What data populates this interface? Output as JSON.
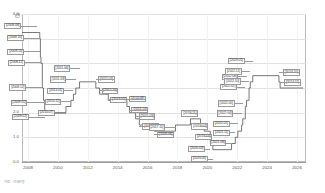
{
  "chart": {
    "unit_label": "(연 %)",
    "footnote": "자료 : 한국은행",
    "yaxis": {
      "ticks": [
        "6.0",
        "5.0",
        "4.0",
        "3.0",
        "2.0",
        "1.0",
        "0.0"
      ],
      "min": 0.0,
      "max": 6.0
    },
    "xaxis": {
      "ticks": [
        "2008",
        "2010",
        "2012",
        "2014",
        "2016",
        "2018",
        "2020",
        "2022",
        "2024",
        "2026"
      ],
      "min": 2007.6,
      "max": 2026.6
    }
  },
  "chart_data": {
    "type": "line",
    "title": "",
    "subtitle": "",
    "xlabel": "",
    "ylabel": "(연 %)",
    "xlim": [
      2007.6,
      2026.6
    ],
    "ylim": [
      0.0,
      6.0
    ],
    "grid": true,
    "legend": "none",
    "step": "post",
    "series": [
      {
        "name": "기준금리",
        "points": [
          {
            "date": "2008.08",
            "x": 2008.62,
            "y": 5.25
          },
          {
            "date": "2008.10",
            "x": 2008.79,
            "y": 5.0
          },
          {
            "date": "2008.10",
            "x": 2008.83,
            "y": 4.25
          },
          {
            "date": "2008.11",
            "x": 2008.87,
            "y": 4.0
          },
          {
            "date": "2008.12",
            "x": 2008.96,
            "y": 3.0
          },
          {
            "date": "2009.01",
            "x": 2009.04,
            "y": 2.5
          },
          {
            "date": "2009.02",
            "x": 2009.12,
            "y": 2.0
          },
          {
            "date": "2010.07",
            "x": 2010.54,
            "y": 2.25
          },
          {
            "date": "2010.11",
            "x": 2010.87,
            "y": 2.5
          },
          {
            "date": "2011.01",
            "x": 2011.04,
            "y": 2.75
          },
          {
            "date": "2011.03",
            "x": 2011.2,
            "y": 3.0
          },
          {
            "date": "2011.06",
            "x": 2011.45,
            "y": 3.25
          },
          {
            "date": "2012.07",
            "x": 2012.54,
            "y": 3.0
          },
          {
            "date": "2012.10",
            "x": 2012.79,
            "y": 2.75
          },
          {
            "date": "2013.05",
            "x": 2013.37,
            "y": 2.5
          },
          {
            "date": "2014.08",
            "x": 2014.62,
            "y": 2.25
          },
          {
            "date": "2014.10",
            "x": 2014.79,
            "y": 2.0
          },
          {
            "date": "2015.03",
            "x": 2015.2,
            "y": 1.75
          },
          {
            "date": "2015.06",
            "x": 2015.45,
            "y": 1.5
          },
          {
            "date": "2016.06",
            "x": 2016.45,
            "y": 1.25
          },
          {
            "date": "2017.11",
            "x": 2017.87,
            "y": 1.5
          },
          {
            "date": "2018.11",
            "x": 2018.87,
            "y": 1.75
          },
          {
            "date": "2019.07",
            "x": 2019.54,
            "y": 1.5
          },
          {
            "date": "2019.10",
            "x": 2019.79,
            "y": 1.25
          },
          {
            "date": "2020.03",
            "x": 2020.2,
            "y": 0.75
          },
          {
            "date": "2020.05",
            "x": 2020.37,
            "y": 0.5
          },
          {
            "date": "2021.08",
            "x": 2021.62,
            "y": 0.75
          },
          {
            "date": "2021.11",
            "x": 2021.87,
            "y": 1.0
          },
          {
            "date": "2022.01",
            "x": 2022.04,
            "y": 1.25
          },
          {
            "date": "2022.04",
            "x": 2022.29,
            "y": 1.5
          },
          {
            "date": "2022.05",
            "x": 2022.37,
            "y": 1.75
          },
          {
            "date": "2022.07",
            "x": 2022.54,
            "y": 2.25
          },
          {
            "date": "2022.08",
            "x": 2022.62,
            "y": 2.5
          },
          {
            "date": "2022.10",
            "x": 2022.79,
            "y": 3.0
          },
          {
            "date": "2022.11",
            "x": 2022.87,
            "y": 3.25
          },
          {
            "date": "2023.01",
            "x": 2023.04,
            "y": 3.5
          },
          {
            "date": "2024.10",
            "x": 2024.79,
            "y": 3.25
          },
          {
            "date": "2024.11",
            "x": 2024.87,
            "y": 3.0
          },
          {
            "date": "END",
            "x": 2026.4,
            "y": 3.0
          }
        ]
      }
    ],
    "annotations": [
      {
        "label": "[2008.08]",
        "x": 2008.62,
        "y": 5.25
      },
      {
        "label": "[2008.10]",
        "x": 2008.79,
        "y": 5.0
      },
      {
        "label": "[2008.10]",
        "x": 2008.83,
        "y": 4.25
      },
      {
        "label": "[2008.11]",
        "x": 2008.87,
        "y": 4.0
      },
      {
        "label": "[2008.12]",
        "x": 2008.96,
        "y": 3.0
      },
      {
        "label": "[2009.01]",
        "x": 2009.04,
        "y": 2.5
      },
      {
        "label": "[2009.02]",
        "x": 2009.12,
        "y": 2.0
      },
      {
        "label": "[2010.07]",
        "x": 2010.54,
        "y": 2.25
      },
      {
        "label": "[2010.11]",
        "x": 2010.87,
        "y": 2.5
      },
      {
        "label": "[2011.01]",
        "x": 2011.04,
        "y": 2.75
      },
      {
        "label": "[2011.03]",
        "x": 2011.2,
        "y": 3.0
      },
      {
        "label": "[2011.06]",
        "x": 2011.45,
        "y": 3.25
      },
      {
        "label": "[2012.07]",
        "x": 2012.54,
        "y": 3.0
      },
      {
        "label": "[2012.10]",
        "x": 2012.79,
        "y": 2.75
      },
      {
        "label": "[2013.05]",
        "x": 2013.37,
        "y": 2.5
      },
      {
        "label": "[2014.08]",
        "x": 2014.62,
        "y": 2.25
      },
      {
        "label": "[2014.10]",
        "x": 2014.79,
        "y": 2.0
      },
      {
        "label": "[2015.03]",
        "x": 2015.2,
        "y": 1.75
      },
      {
        "label": "[2015.06]",
        "x": 2015.45,
        "y": 1.5
      },
      {
        "label": "[2016.06]",
        "x": 2016.45,
        "y": 1.25
      },
      {
        "label": "[2017.11]",
        "x": 2017.87,
        "y": 1.5
      },
      {
        "label": "[2018.11]",
        "x": 2018.87,
        "y": 1.75
      },
      {
        "label": "[2019.07]",
        "x": 2019.54,
        "y": 1.5
      },
      {
        "label": "[2019.10]",
        "x": 2019.79,
        "y": 1.25
      },
      {
        "label": "[2020.03]",
        "x": 2020.2,
        "y": 0.75
      },
      {
        "label": "[2020.05]",
        "x": 2020.37,
        "y": 0.5
      },
      {
        "label": "[2021.08]",
        "x": 2021.62,
        "y": 0.75
      },
      {
        "label": "[2021.11]",
        "x": 2021.87,
        "y": 1.0
      },
      {
        "label": "[2022.01]",
        "x": 2022.04,
        "y": 1.25
      },
      {
        "label": "[2022.04]",
        "x": 2022.29,
        "y": 1.5
      },
      {
        "label": "[2022.05]",
        "x": 2022.37,
        "y": 1.75
      },
      {
        "label": "[2022.07]",
        "x": 2022.54,
        "y": 2.25
      },
      {
        "label": "[2022.08]",
        "x": 2022.62,
        "y": 2.5
      },
      {
        "label": "[2022.10]",
        "x": 2022.79,
        "y": 3.0
      },
      {
        "label": "[2022.11]",
        "x": 2022.87,
        "y": 3.25
      },
      {
        "label": "[2023.01]",
        "x": 2023.04,
        "y": 3.5
      },
      {
        "label": "[2024.10]",
        "x": 2024.79,
        "y": 3.25
      },
      {
        "label": "[2024.11]",
        "x": 2024.87,
        "y": 3.0
      }
    ]
  }
}
